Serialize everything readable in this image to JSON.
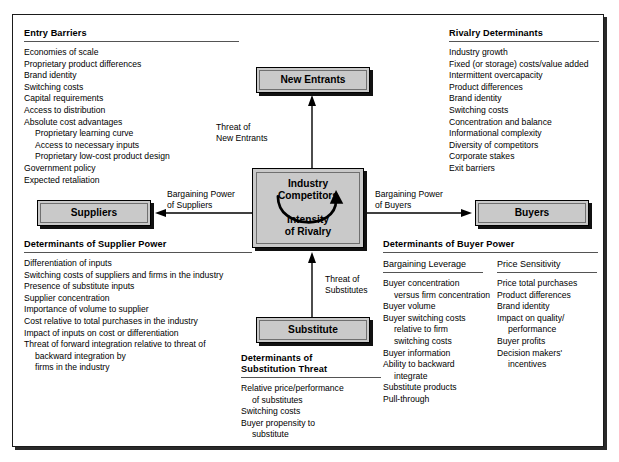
{
  "diagram": {
    "colors": {
      "node_fill": "#c9c9c9",
      "node_border": "#000000",
      "shadow": "#111111",
      "rule": "#545454",
      "text": "#000000",
      "background": "#ffffff"
    }
  },
  "nodes": {
    "new_entrants": {
      "label": "New Entrants"
    },
    "industry_competitors": {
      "label": "Industry\nCompetitors",
      "label_line1": "Industry",
      "label_line2": "Competitors",
      "sublabel_line1": "Intensity",
      "sublabel_line2": "of Rivalry"
    },
    "suppliers": {
      "label": "Suppliers"
    },
    "buyers": {
      "label": "Buyers"
    },
    "substitute": {
      "label": "Substitute"
    }
  },
  "edges": {
    "threat_of_new_entrants": {
      "line1": "Threat of",
      "line2": "New Entrants",
      "direction": "up"
    },
    "threat_of_substitutes": {
      "line1": "Threat of",
      "line2": "Substitutes",
      "direction": "up"
    },
    "bargaining_power_of_suppliers": {
      "line1": "Bargaining Power",
      "line2": "of Suppliers",
      "direction": "left"
    },
    "bargaining_power_of_buyers": {
      "line1": "Bargaining Power",
      "line2": "of Buyers",
      "direction": "right"
    }
  },
  "blocks": {
    "entry_barriers": {
      "title": "Entry Barriers",
      "items": [
        {
          "text": "Economies of scale",
          "indent": 0
        },
        {
          "text": "Proprietary product differences",
          "indent": 0
        },
        {
          "text": "Brand identity",
          "indent": 0
        },
        {
          "text": "Switching costs",
          "indent": 0
        },
        {
          "text": "Capital requirements",
          "indent": 0
        },
        {
          "text": "Access to distribution",
          "indent": 0
        },
        {
          "text": "Absolute cost advantages",
          "indent": 0
        },
        {
          "text": "Proprietary learning curve",
          "indent": 1
        },
        {
          "text": "Access to necessary inputs",
          "indent": 1
        },
        {
          "text": "Proprietary low-cost product design",
          "indent": 1
        },
        {
          "text": "Government policy",
          "indent": 0
        },
        {
          "text": "Expected retaliation",
          "indent": 0
        }
      ]
    },
    "rivalry_determinants": {
      "title": "Rivalry Determinants",
      "items": [
        {
          "text": "Industry growth",
          "indent": 0
        },
        {
          "text": "Fixed (or storage) costs/value added",
          "indent": 0
        },
        {
          "text": "Intermittent overcapacity",
          "indent": 0
        },
        {
          "text": "Product differences",
          "indent": 0
        },
        {
          "text": "Brand identity",
          "indent": 0
        },
        {
          "text": "Switching costs",
          "indent": 0
        },
        {
          "text": "Concentration and balance",
          "indent": 0
        },
        {
          "text": "Informational complexity",
          "indent": 0
        },
        {
          "text": "Diversity of competitors",
          "indent": 0
        },
        {
          "text": "Corporate stakes",
          "indent": 0
        },
        {
          "text": "Exit barriers",
          "indent": 0
        }
      ]
    },
    "supplier_power": {
      "title": "Determinants of Supplier Power",
      "items": [
        {
          "text": "Differentiation of inputs",
          "indent": 0
        },
        {
          "text": "Switching costs of suppliers and firms in the industry",
          "indent": 0
        },
        {
          "text": "Presence of substitute inputs",
          "indent": 0
        },
        {
          "text": "Supplier concentration",
          "indent": 0
        },
        {
          "text": "Importance of volume to supplier",
          "indent": 0
        },
        {
          "text": "Cost relative to total purchases in the industry",
          "indent": 0
        },
        {
          "text": "Impact of inputs on cost or differentiation",
          "indent": 0
        },
        {
          "text": "Threat of forward integration relative to threat of",
          "indent": 0
        },
        {
          "text": "backward integration by",
          "indent": 1
        },
        {
          "text": "firms in the industry",
          "indent": 1
        }
      ]
    },
    "buyer_power": {
      "title": "Determinants of Buyer Power",
      "columns": [
        {
          "heading": "Bargaining Leverage",
          "items": [
            {
              "text": "Buyer concentration",
              "indent": 0
            },
            {
              "text": "versus firm concentration",
              "indent": 1
            },
            {
              "text": "Buyer volume",
              "indent": 0
            },
            {
              "text": "Buyer switching costs",
              "indent": 0
            },
            {
              "text": "relative to firm",
              "indent": 1
            },
            {
              "text": "switching costs",
              "indent": 1
            },
            {
              "text": "Buyer information",
              "indent": 0
            },
            {
              "text": "Ability to backward",
              "indent": 0
            },
            {
              "text": "integrate",
              "indent": 1
            },
            {
              "text": "Substitute products",
              "indent": 0
            },
            {
              "text": "Pull-through",
              "indent": 0
            }
          ]
        },
        {
          "heading": "Price Sensitivity",
          "items": [
            {
              "text": "Price total purchases",
              "indent": 0
            },
            {
              "text": "Product differences",
              "indent": 0
            },
            {
              "text": "Brand identity",
              "indent": 0
            },
            {
              "text": "Impact on quality/",
              "indent": 0
            },
            {
              "text": "performance",
              "indent": 1
            },
            {
              "text": "Buyer profits",
              "indent": 0
            },
            {
              "text": "Decision makers'",
              "indent": 0
            },
            {
              "text": "incentives",
              "indent": 1
            }
          ]
        }
      ]
    },
    "substitution_threat": {
      "title_line1": "Determinants of",
      "title_line2": "Substitution Threat",
      "items": [
        {
          "text": "Relative price/performance",
          "indent": 0
        },
        {
          "text": "of substitutes",
          "indent": 1
        },
        {
          "text": "Switching costs",
          "indent": 0
        },
        {
          "text": "Buyer propensity to",
          "indent": 0
        },
        {
          "text": "substitute",
          "indent": 1
        }
      ]
    }
  }
}
